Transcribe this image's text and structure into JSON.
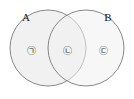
{
  "figure": {
    "name": "two-set-venn-diagram",
    "background_color": "#ffffff"
  },
  "sets": [
    {
      "id": "A",
      "label": "A",
      "label_x": 26,
      "label_y": 21,
      "center_x": 48,
      "center_y": 48,
      "radius": 38,
      "fill_color": "#f0f0f0",
      "stroke_color": "#7a7a7a"
    },
    {
      "id": "B",
      "label": "B",
      "label_x": 108,
      "label_y": 21,
      "center_x": 86,
      "center_y": 48,
      "radius": 38,
      "fill_color": "#f0f0f0",
      "stroke_color": "#7a7a7a"
    }
  ],
  "regions": [
    {
      "id": "A-only",
      "mark": "㉠",
      "x": 31,
      "y": 51,
      "description": "A only"
    },
    {
      "id": "A-and-B",
      "mark": "㉡",
      "x": 67,
      "y": 51,
      "description": "A intersect B"
    },
    {
      "id": "B-only",
      "mark": "㉢",
      "x": 103,
      "y": 51,
      "description": "B only"
    }
  ]
}
